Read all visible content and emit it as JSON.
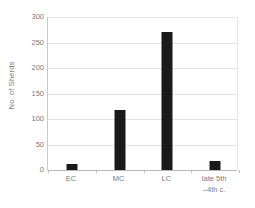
{
  "chart_data": {
    "type": "bar",
    "title": "",
    "subtitle": "",
    "xlabel": "",
    "ylabel": "No. of Sherds",
    "categories": [
      "EC",
      "MC",
      "LC",
      "late 5th\n–4th c."
    ],
    "category_lines": [
      [
        "EC"
      ],
      [
        "MC"
      ],
      [
        "LC"
      ],
      [
        "late 5th",
        "–4th c."
      ]
    ],
    "values": [
      12,
      117,
      271,
      17
    ],
    "ylim": [
      0,
      300
    ],
    "yticks": [
      0,
      50,
      100,
      150,
      200,
      250,
      300
    ],
    "ytick_labels": [
      "0",
      "50",
      "100",
      "150",
      "200",
      "250",
      "300"
    ],
    "grid": true,
    "grid_axis": "y",
    "legend": false,
    "legend_position": "none",
    "bar_color": "#1a1a1a",
    "grid_color": "#e3e3e3",
    "axis_color": "#b9b9b9",
    "text_color": "#7b7b7b",
    "background_color": "#ffffff"
  }
}
